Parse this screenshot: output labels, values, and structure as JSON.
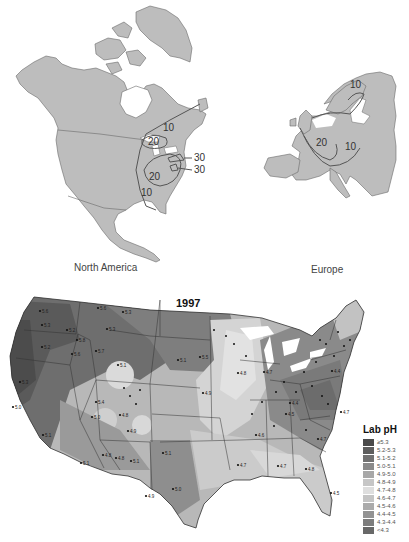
{
  "figure": {
    "top_left": {
      "caption": "North America",
      "contours": [
        {
          "label": "10",
          "x": 163,
          "y": 127
        },
        {
          "label": "20",
          "x": 151,
          "y": 143
        },
        {
          "label": "30",
          "x": 195,
          "y": 158
        },
        {
          "label": "30",
          "x": 195,
          "y": 170
        },
        {
          "label": "20",
          "x": 150,
          "y": 178
        },
        {
          "label": "10",
          "x": 143,
          "y": 194
        }
      ]
    },
    "top_right": {
      "caption": "Europe",
      "contours": [
        {
          "label": "10",
          "x": 354,
          "y": 83
        },
        {
          "label": "20",
          "x": 318,
          "y": 147
        },
        {
          "label": "10",
          "x": 347,
          "y": 150
        }
      ]
    },
    "bottom": {
      "title": "1997",
      "legend": {
        "title": "Lab pH",
        "items": [
          {
            "label": "≥5.3",
            "color": "#4a4a4a"
          },
          {
            "label": "5.2-5.3",
            "color": "#5e5e5e"
          },
          {
            "label": "5.1-5.2",
            "color": "#727272"
          },
          {
            "label": "5.0-5.1",
            "color": "#8a8a8a"
          },
          {
            "label": "4.9-5.0",
            "color": "#a8a8a8"
          },
          {
            "label": "4.8-4.9",
            "color": "#c6c6c6"
          },
          {
            "label": "4.7-4.8",
            "color": "#dedede"
          },
          {
            "label": "4.6-4.7",
            "color": "#c4c4c4"
          },
          {
            "label": "4.5-4.6",
            "color": "#ababab"
          },
          {
            "label": "4.4-4.5",
            "color": "#939393"
          },
          {
            "label": "4.3-4.4",
            "color": "#7d7d7d"
          },
          {
            "label": "<4.3",
            "color": "#686868"
          }
        ]
      },
      "site_values": [
        {
          "v": "5.6",
          "x": 42,
          "y": 312
        },
        {
          "v": "5.6",
          "x": 100,
          "y": 309
        },
        {
          "v": "5.3",
          "x": 125,
          "y": 313
        },
        {
          "v": "5.3",
          "x": 44,
          "y": 326
        },
        {
          "v": "5.2",
          "x": 69,
          "y": 331
        },
        {
          "v": "5.3",
          "x": 109,
          "y": 330
        },
        {
          "v": "5.2",
          "x": 44,
          "y": 348
        },
        {
          "v": "5.6",
          "x": 74,
          "y": 355
        },
        {
          "v": "5.8",
          "x": 79,
          "y": 341
        },
        {
          "v": "5.7",
          "x": 98,
          "y": 352
        },
        {
          "v": "5.1",
          "x": 120,
          "y": 366
        },
        {
          "v": "5.1",
          "x": 180,
          "y": 361
        },
        {
          "v": "5.5",
          "x": 202,
          "y": 358
        },
        {
          "v": "5.3",
          "x": 22,
          "y": 383
        },
        {
          "v": "5.4",
          "x": 98,
          "y": 403
        },
        {
          "v": "5.0",
          "x": 94,
          "y": 418
        },
        {
          "v": "4.8",
          "x": 122,
          "y": 416
        },
        {
          "v": "4.9",
          "x": 130,
          "y": 432
        },
        {
          "v": "5.1",
          "x": 45,
          "y": 436
        },
        {
          "v": "4.8",
          "x": 105,
          "y": 456
        },
        {
          "v": "4.8",
          "x": 118,
          "y": 459
        },
        {
          "v": "5.1",
          "x": 83,
          "y": 464
        },
        {
          "v": "5.1",
          "x": 133,
          "y": 462
        },
        {
          "v": "5.1",
          "x": 165,
          "y": 454
        },
        {
          "v": "5.0",
          "x": 175,
          "y": 490
        },
        {
          "v": "4.9",
          "x": 148,
          "y": 497
        },
        {
          "v": "4.9",
          "x": 205,
          "y": 394
        },
        {
          "v": "4.8",
          "x": 240,
          "y": 374
        },
        {
          "v": "4.7",
          "x": 266,
          "y": 373
        },
        {
          "v": "4.4",
          "x": 292,
          "y": 404
        },
        {
          "v": "4.5",
          "x": 288,
          "y": 415
        },
        {
          "v": "4.4",
          "x": 334,
          "y": 372
        },
        {
          "v": "4.6",
          "x": 258,
          "y": 436
        },
        {
          "v": "4.7",
          "x": 240,
          "y": 466
        },
        {
          "v": "4.7",
          "x": 280,
          "y": 467
        },
        {
          "v": "4.8",
          "x": 308,
          "y": 470
        },
        {
          "v": "4.5",
          "x": 333,
          "y": 494
        },
        {
          "v": "4.7",
          "x": 343,
          "y": 413
        },
        {
          "v": "4.7",
          "x": 320,
          "y": 440
        },
        {
          "v": "5.0",
          "x": 15,
          "y": 408
        }
      ]
    }
  }
}
